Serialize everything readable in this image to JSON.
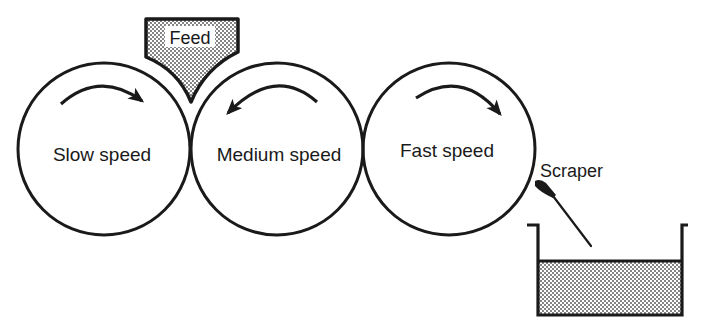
{
  "diagram": {
    "type": "three-roll mill schematic",
    "colors": {
      "line": "#1a1a1a",
      "background": "#ffffff",
      "stipple": "#9a9a9a"
    },
    "feed": {
      "label": "Feed"
    },
    "rollers": [
      {
        "label": "Slow speed",
        "rotation": "clockwise"
      },
      {
        "label": "Medium speed",
        "rotation": "counter-clockwise"
      },
      {
        "label": "Fast speed",
        "rotation": "clockwise"
      }
    ],
    "scraper": {
      "label": "Scraper"
    },
    "collector": {
      "contents": "milled product"
    }
  }
}
